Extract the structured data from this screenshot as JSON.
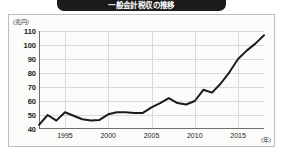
{
  "title": {
    "text": "一般会計税収の推移"
  },
  "chart_data": {
    "type": "line",
    "title": "一般会計税収の推移",
    "xlabel": "(年)",
    "ylabel": "(兆円)",
    "ylim": [
      40,
      110
    ],
    "xlim": [
      1992,
      2018
    ],
    "ytick_labels": [
      "110",
      "100",
      "90",
      "80",
      "70",
      "60",
      "50",
      "40"
    ],
    "yticks": [
      110,
      100,
      90,
      80,
      70,
      60,
      50,
      40
    ],
    "xtick_labels": [
      "1995",
      "2000",
      "2005",
      "2010",
      "2015"
    ],
    "xticks": [
      1995,
      2000,
      2005,
      2010,
      2015
    ],
    "grid": true,
    "legend": "none",
    "line_color": "#1b1b1b",
    "series": [
      {
        "name": "税収",
        "x": [
          1992,
          1993,
          1994,
          1995,
          1996,
          1997,
          1998,
          1999,
          2000,
          2001,
          2002,
          2003,
          2004,
          2005,
          2006,
          2007,
          2008,
          2009,
          2010,
          2011,
          2012,
          2013,
          2014,
          2015,
          2016,
          2017,
          2018
        ],
        "values": [
          43.0,
          50.0,
          46.0,
          52.0,
          49.5,
          47.0,
          46.0,
          46.5,
          50.5,
          52.0,
          52.0,
          51.5,
          51.5,
          55.5,
          58.5,
          62.0,
          58.5,
          57.5,
          60.0,
          68.0,
          66.0,
          72.5,
          80.5,
          90.0,
          96.0,
          101.0,
          107.0
        ]
      }
    ]
  },
  "axis": {
    "y_unit": "(兆円)",
    "x_unit": "(年)"
  }
}
